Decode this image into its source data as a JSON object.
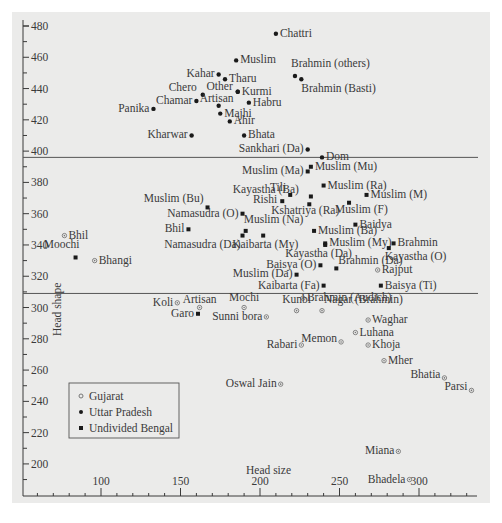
{
  "chart_data": {
    "type": "scatter",
    "title": "",
    "xlabel": "Head size",
    "ylabel": "Head shape",
    "xlim": [
      51,
      337
    ],
    "ylim": [
      190,
      484
    ],
    "x_ticks": [
      100,
      150,
      200,
      250,
      300
    ],
    "y_ticks": [
      200,
      220,
      240,
      260,
      280,
      300,
      320,
      340,
      360,
      380,
      400,
      420,
      440,
      460,
      480
    ],
    "grid": false,
    "legend_position": "lower-left",
    "separator_lines_y": [
      396,
      309
    ],
    "legend": [
      {
        "name": "Gujarat",
        "marker": "asterisk"
      },
      {
        "name": "Uttar Pradesh",
        "marker": "dot"
      },
      {
        "name": "Undivided Bengal",
        "marker": "square"
      }
    ],
    "series": [
      {
        "name": "Uttar Pradesh",
        "marker": "dot",
        "points": [
          {
            "label": "Chattri",
            "x": 210,
            "y": 475
          },
          {
            "label": "Muslim",
            "x": 185,
            "y": 458
          },
          {
            "label": "Brahmin (others)",
            "x": 222,
            "y": 448
          },
          {
            "label": "Brahmin (Basti)",
            "x": 226,
            "y": 446
          },
          {
            "label": "Kahar",
            "x": 174,
            "y": 449
          },
          {
            "label": "Tharu",
            "x": 178,
            "y": 446
          },
          {
            "label": "Kurmi",
            "x": 186,
            "y": 438
          },
          {
            "label": "Other",
            "x": 186,
            "y": 438
          },
          {
            "label": "Chero",
            "x": 164,
            "y": 436
          },
          {
            "label": "Chamar",
            "x": 160,
            "y": 432
          },
          {
            "label": "Artisan",
            "x": 174,
            "y": 429
          },
          {
            "label": "Habru",
            "x": 193,
            "y": 431
          },
          {
            "label": "Panika",
            "x": 133,
            "y": 427
          },
          {
            "label": "Majhi",
            "x": 175,
            "y": 424
          },
          {
            "label": "Ahir",
            "x": 181,
            "y": 419
          },
          {
            "label": "Kharwar",
            "x": 157,
            "y": 410
          },
          {
            "label": "Bhata",
            "x": 190,
            "y": 410
          },
          {
            "label": "Sankhari (Da)",
            "x": 230,
            "y": 401
          },
          {
            "label": "Dom",
            "x": 239,
            "y": 396
          }
        ]
      },
      {
        "name": "Undivided Bengal",
        "marker": "square",
        "points": [
          {
            "label": "Muslim (Mu)",
            "x": 232,
            "y": 390
          },
          {
            "label": "Muslim (Ma)",
            "x": 230,
            "y": 387
          },
          {
            "label": "Muslim (Ra)",
            "x": 240,
            "y": 378
          },
          {
            "label": "Tili",
            "x": 219,
            "y": 372
          },
          {
            "label": "Kayastha (Ba)",
            "x": 232,
            "y": 371
          },
          {
            "label": "Rishi",
            "x": 214,
            "y": 368
          },
          {
            "label": "Muslim (M)",
            "x": 267,
            "y": 372
          },
          {
            "label": "Muslim (F)",
            "x": 256,
            "y": 367
          },
          {
            "label": "Kshatriya (Ra)",
            "x": 231,
            "y": 366
          },
          {
            "label": "Muslim (Bu)",
            "x": 167,
            "y": 364
          },
          {
            "label": "Namasudra (O)",
            "x": 189,
            "y": 360
          },
          {
            "label": "Muslim (Na)",
            "x": 191,
            "y": 349
          },
          {
            "label": "Namasudra (Da)",
            "x": 189,
            "y": 346
          },
          {
            "label": "Kaibarta (My)",
            "x": 202,
            "y": 346
          },
          {
            "label": "Muslim (Ba)",
            "x": 234,
            "y": 349
          },
          {
            "label": "Bhil",
            "x": 155,
            "y": 350
          },
          {
            "label": "Baidya",
            "x": 260,
            "y": 353
          },
          {
            "label": "Muslim (My)",
            "x": 241,
            "y": 341
          },
          {
            "label": "Kayastha (Da)",
            "x": 241,
            "y": 340
          },
          {
            "label": "Brahmin",
            "x": 284,
            "y": 341
          },
          {
            "label": "Kayastha (O)",
            "x": 281,
            "y": 338
          },
          {
            "label": "Baisya (O)",
            "x": 238,
            "y": 327
          },
          {
            "label": "Brahmin (Da)",
            "x": 248,
            "y": 325
          },
          {
            "label": "Muslim (Da)",
            "x": 223,
            "y": 321
          },
          {
            "label": "Kaibarta (Fa)",
            "x": 240,
            "y": 314
          },
          {
            "label": "Baisya (Ti)",
            "x": 276,
            "y": 314
          },
          {
            "label": "Garo",
            "x": 161,
            "y": 296
          },
          {
            "label": "Moochi",
            "x": 84,
            "y": 332
          }
        ]
      },
      {
        "name": "Gujarat",
        "marker": "asterisk",
        "points": [
          {
            "label": "Bhil",
            "x": 77,
            "y": 346
          },
          {
            "label": "Bhangi",
            "x": 96,
            "y": 330
          },
          {
            "label": "Rajput",
            "x": 274,
            "y": 324
          },
          {
            "label": "Koli",
            "x": 148,
            "y": 303
          },
          {
            "label": "Artisan",
            "x": 162,
            "y": 300
          },
          {
            "label": "Mochi",
            "x": 190,
            "y": 300
          },
          {
            "label": "Sunni bora",
            "x": 204,
            "y": 294
          },
          {
            "label": "Brahmin (Audich)",
            "x": 227,
            "y": 306
          },
          {
            "label": "Kunbi",
            "x": 223,
            "y": 298
          },
          {
            "label": "Nagar (Brahmin)",
            "x": 239,
            "y": 298
          },
          {
            "label": "Waghar",
            "x": 268,
            "y": 292
          },
          {
            "label": "Luhana",
            "x": 260,
            "y": 284
          },
          {
            "label": "Memon",
            "x": 251,
            "y": 278
          },
          {
            "label": "Rabari",
            "x": 226,
            "y": 276
          },
          {
            "label": "Khoja",
            "x": 268,
            "y": 276
          },
          {
            "label": "Mher",
            "x": 278,
            "y": 266
          },
          {
            "label": "Bhatia",
            "x": 316,
            "y": 255
          },
          {
            "label": "Oswal Jain",
            "x": 213,
            "y": 251
          },
          {
            "label": "Parsi",
            "x": 333,
            "y": 247
          },
          {
            "label": "Miana",
            "x": 287,
            "y": 208
          },
          {
            "label": "Bhadela",
            "x": 294,
            "y": 190
          }
        ]
      }
    ]
  },
  "label_layout": {
    "Uttar Pradesh": [
      {
        "text": "Chattri",
        "side": "right"
      },
      {
        "text": "Muslim",
        "side": "right"
      },
      {
        "text": "Brahmin (others)",
        "side": "above"
      },
      {
        "text": "Brahmin (Basti)",
        "side": "below"
      },
      {
        "text": "Kahar",
        "side": "left"
      },
      {
        "text": "Tharu",
        "side": "right"
      },
      {
        "text": "Kurmi",
        "side": "right"
      },
      {
        "text": "Other",
        "side": "left"
      },
      {
        "text": "Chero",
        "side": "above-left"
      },
      {
        "text": "Chamar",
        "side": "left"
      },
      {
        "text": "Artisan",
        "side": "above"
      },
      {
        "text": "Habru",
        "side": "right"
      },
      {
        "text": "Panika",
        "side": "left"
      },
      {
        "text": "Majhi",
        "side": "right"
      },
      {
        "text": "Ahir",
        "side": "right"
      },
      {
        "text": "Kharwar",
        "side": "left"
      },
      {
        "text": "Bhata",
        "side": "right"
      },
      {
        "text": "Sankhari (Da)",
        "side": "left"
      },
      {
        "text": "Dom",
        "side": "right"
      }
    ]
  }
}
